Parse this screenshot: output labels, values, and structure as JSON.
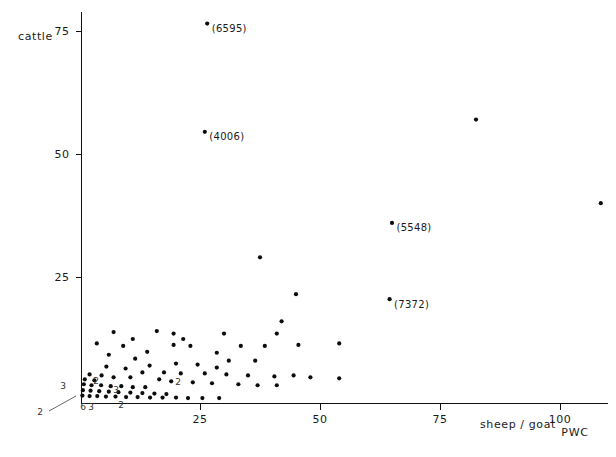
{
  "chart_data": {
    "type": "scatter",
    "title": "",
    "xlabel": "sheep / goat",
    "ylabel": "cattle",
    "corner_tag": "PWC",
    "xlim": [
      0,
      112
    ],
    "ylim": [
      0,
      80
    ],
    "grid": false,
    "legend": null,
    "xticks": [
      25,
      50,
      75,
      100
    ],
    "yticks": [
      25,
      50,
      75
    ],
    "points": [
      {
        "x": 26.5,
        "y": 76.5,
        "label": "(6595)"
      },
      {
        "x": 26.0,
        "y": 54.5,
        "label": "(4006)"
      },
      {
        "x": 65.0,
        "y": 36.0,
        "label": "(5548)"
      },
      {
        "x": 64.5,
        "y": 20.5,
        "label": "(7372)"
      },
      {
        "x": 82.5,
        "y": 57.0,
        "label": ""
      },
      {
        "x": 108.5,
        "y": 40.0,
        "label": ""
      },
      {
        "x": 37.5,
        "y": 29.0,
        "label": ""
      },
      {
        "x": 45.0,
        "y": 21.5,
        "label": ""
      },
      {
        "x": 42.0,
        "y": 16.0,
        "label": ""
      },
      {
        "x": 41.0,
        "y": 13.5,
        "label": ""
      },
      {
        "x": 54.0,
        "y": 11.5,
        "label": ""
      },
      {
        "x": 30.0,
        "y": 13.5,
        "label": ""
      },
      {
        "x": 19.5,
        "y": 13.5,
        "label": ""
      },
      {
        "x": 16.0,
        "y": 14.0,
        "label": ""
      },
      {
        "x": 7.0,
        "y": 13.8,
        "label": ""
      },
      {
        "x": 11.0,
        "y": 12.4,
        "label": ""
      },
      {
        "x": 21.5,
        "y": 12.4,
        "label": ""
      },
      {
        "x": 3.5,
        "y": 11.5,
        "label": ""
      },
      {
        "x": 9.0,
        "y": 11.0,
        "label": ""
      },
      {
        "x": 19.5,
        "y": 11.2,
        "label": ""
      },
      {
        "x": 23.0,
        "y": 11.0,
        "label": ""
      },
      {
        "x": 33.5,
        "y": 11.0,
        "label": ""
      },
      {
        "x": 38.5,
        "y": 11.0,
        "label": ""
      },
      {
        "x": 45.5,
        "y": 11.2,
        "label": ""
      },
      {
        "x": 14.0,
        "y": 9.8,
        "label": ""
      },
      {
        "x": 28.5,
        "y": 9.6,
        "label": ""
      },
      {
        "x": 6.0,
        "y": 9.2,
        "label": ""
      },
      {
        "x": 11.5,
        "y": 8.4,
        "label": ""
      },
      {
        "x": 31.0,
        "y": 8.0,
        "label": ""
      },
      {
        "x": 36.5,
        "y": 8.0,
        "label": ""
      },
      {
        "x": 14.5,
        "y": 7.0,
        "label": ""
      },
      {
        "x": 20.0,
        "y": 7.4,
        "label": ""
      },
      {
        "x": 24.5,
        "y": 7.2,
        "label": ""
      },
      {
        "x": 28.5,
        "y": 6.6,
        "label": ""
      },
      {
        "x": 5.5,
        "y": 6.8,
        "label": ""
      },
      {
        "x": 9.5,
        "y": 6.4,
        "label": ""
      },
      {
        "x": 13.0,
        "y": 5.6,
        "label": ""
      },
      {
        "x": 17.5,
        "y": 5.6,
        "label": ""
      },
      {
        "x": 21.0,
        "y": 5.4,
        "label": ""
      },
      {
        "x": 26.0,
        "y": 5.4,
        "label": ""
      },
      {
        "x": 30.5,
        "y": 5.2,
        "label": ""
      },
      {
        "x": 35.0,
        "y": 5.0,
        "label": ""
      },
      {
        "x": 40.5,
        "y": 4.8,
        "label": ""
      },
      {
        "x": 44.5,
        "y": 5.0,
        "label": ""
      },
      {
        "x": 48.0,
        "y": 4.6,
        "label": ""
      },
      {
        "x": 54.0,
        "y": 4.4,
        "label": ""
      },
      {
        "x": 2.0,
        "y": 5.2,
        "label": ""
      },
      {
        "x": 4.5,
        "y": 5.0,
        "label": ""
      },
      {
        "x": 7.0,
        "y": 4.6,
        "label": ""
      },
      {
        "x": 10.5,
        "y": 4.6,
        "label": ""
      },
      {
        "x": 1.0,
        "y": 4.2,
        "label": ""
      },
      {
        "x": 3.0,
        "y": 4.0,
        "label": ""
      },
      {
        "x": 16.5,
        "y": 4.2,
        "label": ""
      },
      {
        "x": 19.0,
        "y": 3.8,
        "label": ""
      },
      {
        "x": 23.5,
        "y": 3.6,
        "label": ""
      },
      {
        "x": 27.5,
        "y": 3.4,
        "label": ""
      },
      {
        "x": 33.0,
        "y": 3.2,
        "label": ""
      },
      {
        "x": 37.0,
        "y": 3.0,
        "label": ""
      },
      {
        "x": 41.0,
        "y": 3.0,
        "label": ""
      },
      {
        "x": 0.8,
        "y": 3.2,
        "label": ""
      },
      {
        "x": 2.4,
        "y": 3.0,
        "label": ""
      },
      {
        "x": 4.4,
        "y": 3.0,
        "label": ""
      },
      {
        "x": 6.4,
        "y": 2.8,
        "label": ""
      },
      {
        "x": 8.6,
        "y": 2.8,
        "label": ""
      },
      {
        "x": 11.0,
        "y": 2.6,
        "label": ""
      },
      {
        "x": 13.6,
        "y": 2.6,
        "label": ""
      },
      {
        "x": 0.6,
        "y": 2.0,
        "label": ""
      },
      {
        "x": 2.2,
        "y": 1.9,
        "label": ""
      },
      {
        "x": 4.0,
        "y": 1.8,
        "label": ""
      },
      {
        "x": 6.0,
        "y": 1.7,
        "label": ""
      },
      {
        "x": 8.0,
        "y": 1.6,
        "label": ""
      },
      {
        "x": 10.5,
        "y": 1.5,
        "label": ""
      },
      {
        "x": 13.0,
        "y": 1.4,
        "label": ""
      },
      {
        "x": 15.5,
        "y": 1.3,
        "label": ""
      },
      {
        "x": 18.0,
        "y": 1.2,
        "label": ""
      },
      {
        "x": 0.5,
        "y": 0.9,
        "label": ""
      },
      {
        "x": 2.0,
        "y": 0.8,
        "label": ""
      },
      {
        "x": 3.6,
        "y": 0.8,
        "label": ""
      },
      {
        "x": 5.4,
        "y": 0.7,
        "label": ""
      },
      {
        "x": 7.4,
        "y": 0.7,
        "label": ""
      },
      {
        "x": 9.6,
        "y": 0.6,
        "label": ""
      },
      {
        "x": 12.0,
        "y": 0.6,
        "label": ""
      },
      {
        "x": 14.6,
        "y": 0.5,
        "label": ""
      },
      {
        "x": 17.2,
        "y": 0.5,
        "label": ""
      },
      {
        "x": 20.0,
        "y": 0.5,
        "label": ""
      },
      {
        "x": 22.5,
        "y": 0.4,
        "label": ""
      },
      {
        "x": 25.5,
        "y": 0.4,
        "label": ""
      },
      {
        "x": 29.0,
        "y": 0.4,
        "label": ""
      }
    ],
    "overlap_counts": [
      {
        "text": "3",
        "x_px": 63,
        "y_px": 389
      },
      {
        "text": "2",
        "x_px": 96,
        "y_px": 384
      },
      {
        "text": "3",
        "x_px": 116,
        "y_px": 393
      },
      {
        "text": "6",
        "x_px": 83,
        "y_px": 410
      },
      {
        "text": "3",
        "x_px": 91,
        "y_px": 410
      },
      {
        "text": "2",
        "x_px": 121,
        "y_px": 408
      },
      {
        "text": "2",
        "x_px": 178,
        "y_px": 385
      },
      {
        "text": "2",
        "x_px": 40,
        "y_px": 415
      }
    ],
    "leader_lines": [
      {
        "x1": 49,
        "y1": 411,
        "x2": 76,
        "y2": 396
      }
    ]
  },
  "axes": {
    "y_label": "cattle",
    "x_label": "sheep / goat",
    "corner_tag": "PWC",
    "x_tick_labels": [
      "25",
      "50",
      "75",
      "100"
    ],
    "y_tick_labels": [
      "25",
      "50",
      "75"
    ]
  },
  "colors": {
    "point": "#0d0d0d",
    "axis": "#111111",
    "text": "#1a1a1a",
    "background": "#ffffff"
  }
}
